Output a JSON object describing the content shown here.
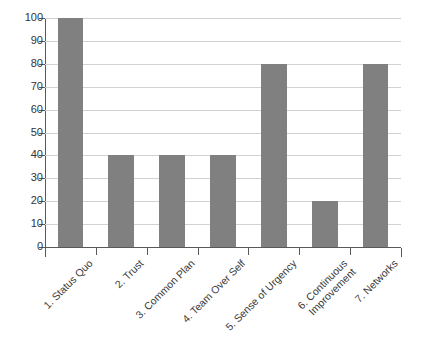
{
  "chart_data": {
    "type": "bar",
    "title": "",
    "subtitle": "",
    "xlabel": "",
    "ylabel": "",
    "ylim": [
      0,
      100
    ],
    "ytick_step": 10,
    "yticks": [
      0,
      10,
      20,
      30,
      40,
      50,
      60,
      70,
      80,
      90,
      100
    ],
    "grid": true,
    "legend": false,
    "legend_position": "none",
    "categories": [
      "1. Status Quo",
      "2. Trust",
      "3. Common Plan",
      "4. Team Over Self",
      "5. Sense of Urgency",
      "6. Continuous Improvement",
      "7. Networks"
    ],
    "category_lines": [
      [
        "1. Status Quo"
      ],
      [
        "2. Trust"
      ],
      [
        "3. Common Plan"
      ],
      [
        "4. Team Over Self"
      ],
      [
        "5. Sense of Urgency"
      ],
      [
        "6. Continuous",
        "Improvement"
      ],
      [
        "7. Networks"
      ]
    ],
    "values": [
      100,
      40,
      40,
      40,
      80,
      20,
      80
    ],
    "series": [
      {
        "name": "",
        "values": [
          100,
          40,
          40,
          40,
          80,
          20,
          80
        ]
      }
    ],
    "colors": {
      "bar": "#808080",
      "gridline": "#d2d2d2",
      "axis": "#595959",
      "tick_label": "#333333",
      "category_label": "#3a3a3a",
      "background": "#ffffff"
    }
  }
}
